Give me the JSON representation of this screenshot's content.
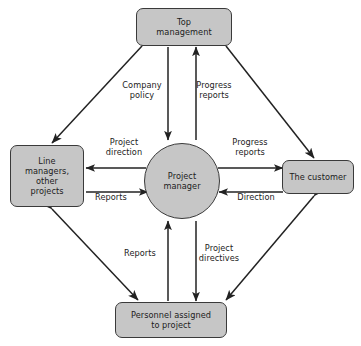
{
  "diagram": {
    "style": {
      "node_fill": "#c6c6c6",
      "node_stroke": "#3a3a3a",
      "arrow_color": "#222222",
      "text_color": "#1c1c1c",
      "background": "#ffffff"
    },
    "nodes": [
      {
        "id": "top",
        "label": "Top\nmanagement",
        "shape": "rounded-rect"
      },
      {
        "id": "left",
        "label": "Line\nmanagers,\nother\nprojects",
        "shape": "rounded-rect"
      },
      {
        "id": "right",
        "label": "The customer",
        "shape": "rounded-rect"
      },
      {
        "id": "bottom",
        "label": "Personnel assigned\nto project",
        "shape": "rounded-rect"
      },
      {
        "id": "center",
        "label": "Project\nmanager",
        "shape": "circle"
      }
    ],
    "spoke_labels": [
      {
        "id": "company-policy",
        "text": "Company\npolicy",
        "from": "top",
        "to": "center",
        "direction": "down"
      },
      {
        "id": "progress-reports-top",
        "text": "Progress\nreports",
        "from": "center",
        "to": "top",
        "direction": "up"
      },
      {
        "id": "project-direction",
        "text": "Project\ndirection",
        "from": "center",
        "to": "left",
        "direction": "left"
      },
      {
        "id": "reports-left",
        "text": "Reports",
        "from": "left",
        "to": "center",
        "direction": "right"
      },
      {
        "id": "progress-reports-right",
        "text": "Progress\nreports",
        "from": "center",
        "to": "right",
        "direction": "right"
      },
      {
        "id": "direction",
        "text": "Direction",
        "from": "right",
        "to": "center",
        "direction": "left"
      },
      {
        "id": "reports-bottom",
        "text": "Reports",
        "from": "bottom",
        "to": "center",
        "direction": "up"
      },
      {
        "id": "project-directives",
        "text": "Project\ndirectives",
        "from": "center",
        "to": "bottom",
        "direction": "down"
      }
    ],
    "perimeter_links": [
      {
        "id": "top-left",
        "from": "top",
        "to": "left",
        "arrows": "both"
      },
      {
        "id": "top-right",
        "from": "top",
        "to": "right",
        "arrows": "both"
      },
      {
        "id": "left-bottom",
        "from": "left",
        "to": "bottom",
        "arrows": "both"
      },
      {
        "id": "right-bottom",
        "from": "right",
        "to": "bottom",
        "arrows": "both"
      }
    ]
  }
}
